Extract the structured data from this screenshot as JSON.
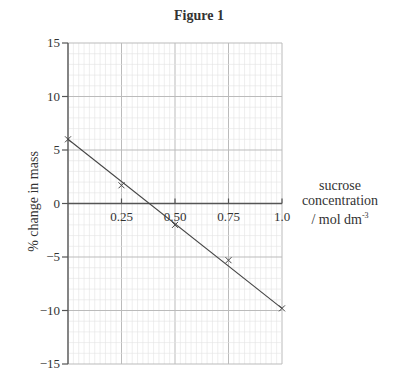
{
  "figure": {
    "title": "Figure 1"
  },
  "chart_data": {
    "type": "scatter",
    "title": "Figure 1",
    "xlabel": "sucrose concentration / mol dm⁻³",
    "ylabel": "% change in mass",
    "xlim": [
      0,
      1.0
    ],
    "ylim": [
      -15,
      15
    ],
    "x_ticks": [
      "0.25",
      "0.50",
      "0.75",
      "1.0"
    ],
    "y_ticks": [
      "15",
      "10",
      "5",
      "0",
      "-5",
      "-10",
      "-15"
    ],
    "grid": true,
    "series": [
      {
        "name": "measured",
        "marker": "x",
        "x": [
          0,
          0.25,
          0.5,
          0.75,
          1.0
        ],
        "y": [
          6.0,
          1.7,
          -2.0,
          -5.3,
          -9.8
        ]
      }
    ],
    "trendline": {
      "x": [
        0,
        1.0
      ],
      "y": [
        6.0,
        -9.8
      ]
    },
    "x_intercept": 0.38
  },
  "labels": {
    "x_line1": "sucrose",
    "x_line2": "concentration",
    "x_line3": "/ mol dm",
    "x_sup": "-3",
    "y": "% change in mass"
  }
}
